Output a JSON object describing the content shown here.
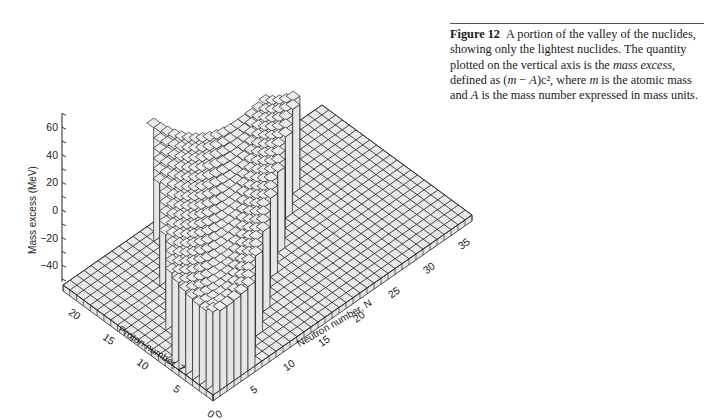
{
  "caption": {
    "figure_label": "Figure 12",
    "text_part1": "A portion of the valley of the nuclides, showing only the lightest nuclides. The quantity plotted on the vertical axis is the ",
    "emphasis": "mass excess,",
    "text_part2": " defined as (",
    "formula_m": "m",
    "formula_minus": " − ",
    "formula_A": "A",
    "text_part3": ")c², where ",
    "m_var": "m",
    "text_part4": " is the atomic mass and ",
    "A_var": "A",
    "text_part5": " is the mass number expressed in mass units."
  },
  "chart_data": {
    "type": "surface3d",
    "zlabel": "Mass excess (MeV)",
    "xlabel": "Neutron number, N",
    "ylabel": "Proton number, Z",
    "z_ticks": [
      60,
      40,
      20,
      0,
      -20,
      -40
    ],
    "z_range": [
      -50,
      70
    ],
    "n_ticks": [
      0,
      5,
      10,
      15,
      20,
      25,
      30,
      35
    ],
    "n_range": [
      0,
      37
    ],
    "z_proton_ticks": [
      0,
      5,
      10,
      15,
      20
    ],
    "proton_range": [
      0,
      22
    ],
    "floor_value_mev": -50,
    "valley_description": "Surface defined along N≈Z band; mass excess low (~-20 to 0 MeV) near the stability line, rising steeply (~70 MeV) toward neutron-rich, proton-poor edge",
    "valley_samples": [
      {
        "N": 0,
        "Z": 2,
        "mass_excess": -10
      },
      {
        "N": 4,
        "Z": 4,
        "mass_excess": 5
      },
      {
        "N": 8,
        "Z": 8,
        "mass_excess": -5
      },
      {
        "N": 12,
        "Z": 12,
        "mass_excess": -15
      },
      {
        "N": 16,
        "Z": 15,
        "mass_excess": -20
      },
      {
        "N": 20,
        "Z": 17,
        "mass_excess": -25
      },
      {
        "N": 22,
        "Z": 14,
        "mass_excess": 10
      },
      {
        "N": 24,
        "Z": 10,
        "mass_excess": 40
      },
      {
        "N": 26,
        "Z": 8,
        "mass_excess": 65
      }
    ]
  }
}
